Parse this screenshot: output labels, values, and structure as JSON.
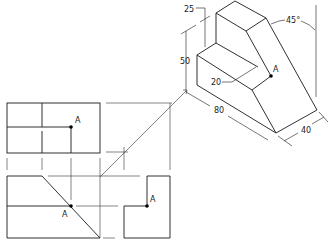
{
  "diagram": {
    "type": "orthographic-projection-with-isometric",
    "colors": {
      "line": "#1a1a1a",
      "background": "#ffffff",
      "point": "#000000"
    },
    "isometric_view": {
      "dimensions": {
        "step_height": "25",
        "overall_height": "50",
        "step_depth": "20",
        "length": "80",
        "width": "40",
        "angle": "45°"
      },
      "point_label": "A"
    },
    "top_view": {
      "point_label": "A"
    },
    "front_view": {
      "point_label": "A"
    },
    "side_view": {
      "point_label": "A"
    }
  }
}
